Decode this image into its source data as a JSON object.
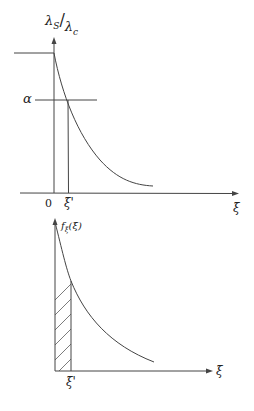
{
  "top_plot": {
    "y_label_num": "λ",
    "y_label_num_sub": "S",
    "y_label_den": "λ",
    "y_label_den_sub": "c",
    "alpha_label": "α",
    "origin_label": "0",
    "xi_prime_label": "ξ̄'",
    "x_axis_label": "ξ̄"
  },
  "bottom_plot": {
    "y_label": "f",
    "y_label_sub": "ξ̄",
    "y_label_arg": "(ξ̄)",
    "xi_prime_label": "ξ̄'",
    "x_axis_label": "ξ̄"
  },
  "colors": {
    "line": "#444444",
    "text": "#222222",
    "background": "#ffffff"
  }
}
